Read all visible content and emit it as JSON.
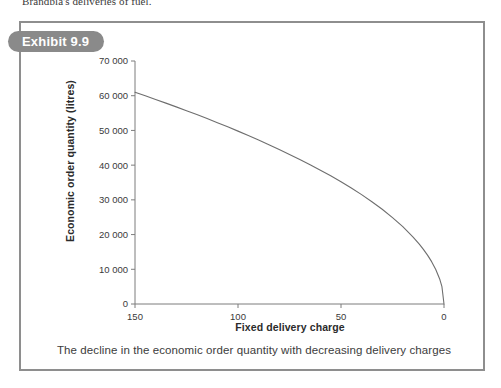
{
  "page": {
    "top_body_text": "Brandbla's deliveries of fuel."
  },
  "exhibit": {
    "pill_label": "Exhibit 9.9",
    "caption": "The decline in the economic order quantity with decreasing delivery charges",
    "pill_color": "#8a8a8a",
    "border_color": "#8e8e8e"
  },
  "chart_data": {
    "type": "line",
    "title": "",
    "xlabel": "Fixed delivery charge",
    "ylabel": "Economic order quantity (litres)",
    "xlim": [
      150,
      0
    ],
    "ylim": [
      0,
      70000
    ],
    "x_reversed": true,
    "grid": false,
    "legend": false,
    "xticks": [
      150,
      100,
      50,
      0
    ],
    "xticklabels": [
      "150",
      "100",
      "50",
      "0"
    ],
    "yticks": [
      0,
      10000,
      20000,
      30000,
      40000,
      50000,
      60000,
      70000
    ],
    "yticklabels": [
      "0",
      "10 000",
      "20 000",
      "30 000",
      "40 000",
      "50 000",
      "60 000",
      "70 000"
    ],
    "line_color": "#6e6e6e",
    "series": [
      {
        "name": "Economic order quantity",
        "x": [
          150,
          145,
          140,
          135,
          130,
          125,
          120,
          115,
          110,
          105,
          100,
          95,
          90,
          85,
          80,
          75,
          70,
          65,
          60,
          55,
          50,
          45,
          40,
          35,
          30,
          25,
          20,
          15,
          12,
          10,
          8,
          6,
          4,
          2,
          1,
          0
        ],
        "values": [
          61000,
          59970,
          58930,
          57870,
          56790,
          55690,
          54570,
          53420,
          52240,
          51040,
          49800,
          48540,
          47240,
          45900,
          44520,
          43100,
          41640,
          40120,
          38560,
          36920,
          35220,
          33410,
          31500,
          29460,
          27280,
          24900,
          22270,
          19290,
          17250,
          15750,
          14090,
          12200,
          9960,
          7040,
          4980,
          0
        ]
      }
    ]
  }
}
